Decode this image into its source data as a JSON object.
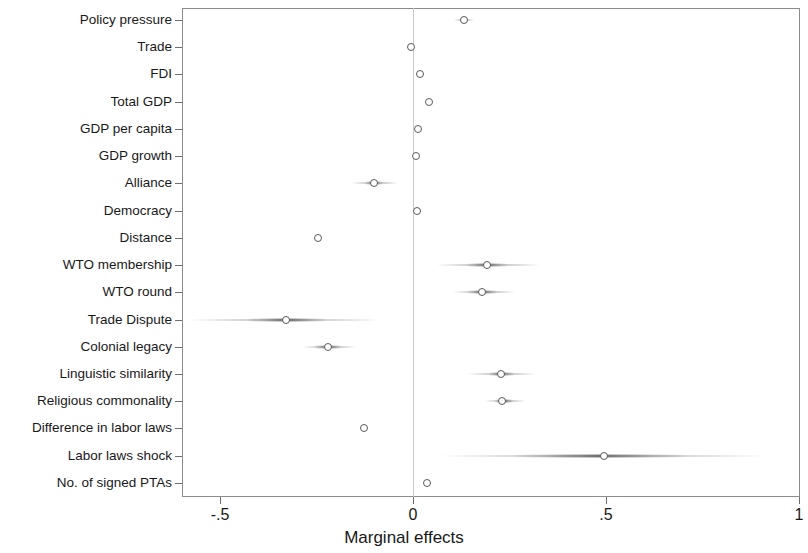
{
  "chart_data": {
    "type": "scatter",
    "title": "",
    "xlabel": "Marginal effects",
    "ylabel": "",
    "xlim": [
      -0.68,
      1.0
    ],
    "xticks": [
      -0.5,
      0,
      0.5,
      1
    ],
    "xticklabels": [
      "-.5",
      "0",
      ".5",
      "1"
    ],
    "grid": false,
    "legend": null,
    "zero_reference_line": 0,
    "marker": "open-circle",
    "categories": [
      "Policy pressure",
      "Trade",
      "FDI",
      "Total GDP",
      "GDP per capita",
      "GDP growth",
      "Alliance",
      "Democracy",
      "Distance",
      "WTO membership",
      "WTO round",
      "Trade Dispute",
      "Colonial legacy",
      "Linguistic similarity",
      "Religious commonality",
      "Difference in labor laws",
      "Labor laws shock",
      "No. of signed PTAs"
    ],
    "values": [
      0.132,
      -0.005,
      0.018,
      0.042,
      0.012,
      0.008,
      -0.101,
      0.01,
      -0.246,
      0.192,
      0.179,
      -0.329,
      -0.22,
      0.228,
      0.231,
      -0.127,
      0.495,
      0.036
    ],
    "ci_low": [
      0.106,
      -0.01,
      0.013,
      0.036,
      0.007,
      0.003,
      -0.158,
      0.005,
      -0.255,
      0.062,
      0.104,
      -0.577,
      -0.285,
      0.142,
      0.186,
      -0.135,
      0.07,
      0.031
    ],
    "ci_high": [
      0.158,
      0.0,
      0.023,
      0.048,
      0.017,
      0.013,
      -0.039,
      0.015,
      -0.237,
      0.329,
      0.264,
      -0.086,
      -0.148,
      0.316,
      0.29,
      -0.119,
      0.912,
      0.041
    ],
    "ci_inner_low": [
      0.122,
      -0.007,
      0.016,
      0.04,
      0.01,
      0.006,
      -0.124,
      0.008,
      -0.251,
      0.14,
      0.143,
      -0.427,
      -0.255,
      0.196,
      0.212,
      -0.13,
      0.27,
      0.034
    ],
    "ci_inner_high": [
      0.142,
      -0.003,
      0.021,
      0.045,
      0.015,
      0.011,
      -0.078,
      0.013,
      -0.241,
      0.243,
      0.218,
      -0.228,
      -0.186,
      0.262,
      0.259,
      -0.124,
      0.7,
      0.038
    ]
  },
  "axis": {
    "x_title": "Marginal effects"
  }
}
